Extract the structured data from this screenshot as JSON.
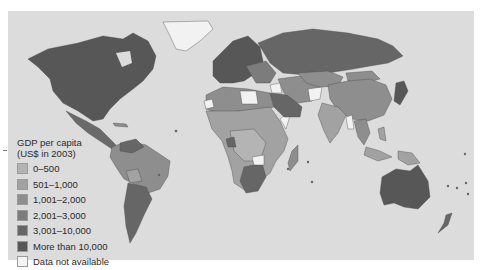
{
  "map": {
    "title": "GDP per capita",
    "subtitle": "(US$ in 2003)",
    "ocean_color": "#dcdcdc",
    "border_color": "#555555"
  },
  "legend": {
    "title_line1": "GDP per capita",
    "title_line2": "(US$ in 2003)",
    "items": [
      {
        "label": "0–500",
        "color": "#b4b4b4"
      },
      {
        "label": "501–1,000",
        "color": "#a2a2a2"
      },
      {
        "label": "1,001–2,000",
        "color": "#8e8e8e"
      },
      {
        "label": "2,001–3,000",
        "color": "#7c7c7c"
      },
      {
        "label": "3,001–10,000",
        "color": "#666666"
      },
      {
        "label": "More than 10,000",
        "color": "#575757"
      },
      {
        "label": "Data not available",
        "color": "#f4f4f4"
      }
    ]
  }
}
